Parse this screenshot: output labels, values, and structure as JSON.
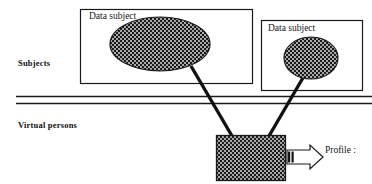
{
  "diagram": {
    "colors": {
      "stroke": "#1a1a1a",
      "fill_pattern": "#595959",
      "background": "#ffffff",
      "text": "#151515"
    },
    "layers": [
      {
        "id": "subjects",
        "label": "Subjects"
      },
      {
        "id": "virtual-persons",
        "label": "Virtual persons"
      }
    ],
    "boxes": [
      {
        "id": "data-subject-left",
        "label": "Data subject",
        "x": 80,
        "y": 9,
        "width": 172,
        "height": 74
      },
      {
        "id": "data-subject-right",
        "label": "Data subject",
        "x": 261,
        "y": 20,
        "width": 101,
        "height": 70
      }
    ],
    "ellipses": [
      {
        "id": "subject-entity-large",
        "cx": 160,
        "cy": 44,
        "rx": 50,
        "ry": 27
      },
      {
        "id": "subject-entity-small",
        "cx": 311,
        "cy": 58,
        "rx": 27,
        "ry": 21
      }
    ],
    "virtual_person": {
      "id": "virtual-person-box",
      "x": 216,
      "y": 135,
      "width": 69,
      "height": 45
    },
    "connectors": [
      {
        "id": "connector-large-subject",
        "x1": 191,
        "y1": 67,
        "x2": 232,
        "y2": 135
      },
      {
        "id": "connector-small-subject",
        "x1": 304,
        "y1": 77,
        "x2": 269,
        "y2": 135
      }
    ],
    "divider_lines": [
      {
        "id": "divider-line-top",
        "y": 96
      },
      {
        "id": "divider-line-bottom",
        "y": 103
      }
    ],
    "profile": {
      "arrow_label": "profile-block-arrow",
      "label": "Profile :"
    }
  }
}
